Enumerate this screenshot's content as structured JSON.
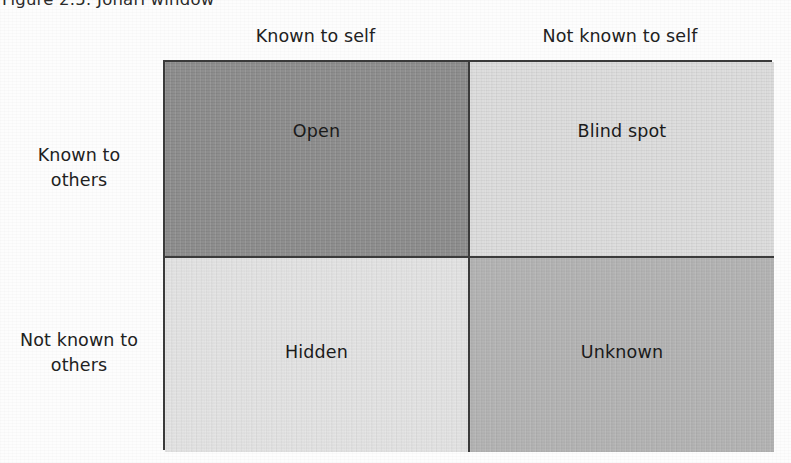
{
  "figure": {
    "caption": "Figure 2.5:  Johari window",
    "background_color": "#fdfdfd",
    "border_color": "#3b3b3b"
  },
  "axes": {
    "columns": [
      {
        "id": "known-self",
        "label": "Known to self"
      },
      {
        "id": "notknown-self",
        "label": "Not known to self"
      }
    ],
    "rows": [
      {
        "id": "known-others",
        "label": "Known to\nothers",
        "line1": "Known to",
        "line2": "others"
      },
      {
        "id": "notknown-others",
        "label": "Not known to\nothers",
        "line1": "Not known to",
        "line2": "others"
      }
    ]
  },
  "chart_data": {
    "type": "table",
    "title": "Johari window",
    "xlabel": "",
    "ylabel": "",
    "grid": true,
    "legend": "none",
    "columns": [
      "Known to self",
      "Not known to self"
    ],
    "rows": [
      "Known to others",
      "Not known to others"
    ],
    "cells": [
      [
        {
          "label": "Open",
          "row": "Known to others",
          "column": "Known to self",
          "fill": "#8c8c8c",
          "shade": "dark-gray"
        },
        {
          "label": "Blind spot",
          "row": "Known to others",
          "column": "Not known to self",
          "fill": "#dcdcdc",
          "shade": "light-gray"
        }
      ],
      [
        {
          "label": "Hidden",
          "row": "Not known to others",
          "column": "Known to self",
          "fill": "#e3e3e3",
          "shade": "lightest-gray"
        },
        {
          "label": "Unknown",
          "row": "Not known to others",
          "column": "Not known to self",
          "fill": "#b3b3b3",
          "shade": "mid-gray"
        }
      ]
    ]
  },
  "quadrants": {
    "open": {
      "label": "Open",
      "fill": "#8c8c8c"
    },
    "blind": {
      "label": "Blind spot",
      "fill": "#dcdcdc"
    },
    "hidden": {
      "label": "Hidden",
      "fill": "#e3e3e3"
    },
    "unknown": {
      "label": "Unknown",
      "fill": "#b3b3b3"
    }
  }
}
